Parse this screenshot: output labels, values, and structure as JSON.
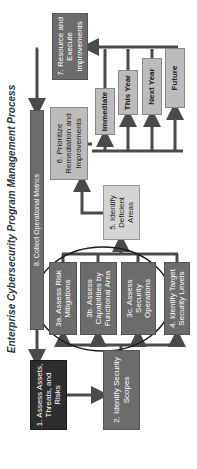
{
  "title": "Enterprise Cybersecurity Program Management Process",
  "steps": {
    "s1": "1. Assess Assets, Threats, and Risks",
    "s2": "2. Identify Security Scopes",
    "s3a": "3a. Assess Risk Mitigations",
    "s3b": "3b. Assess Capabilities by Functional Area",
    "s3c": "3c. Assess Security Operations",
    "s4": "4. Identify Target Security Levels",
    "s5": "5. Identify Deficient Areas",
    "s6": "6. Prioritize Remediation and Improvements",
    "s7": "7. Resource and Execute Improvements",
    "s8": "8. Collect Operational Metrics"
  },
  "priorities": [
    "Immediate",
    "This Year",
    "Next Year",
    "Future"
  ],
  "colors": {
    "dark": "#2e2e2e",
    "mid": "#6c6c6c",
    "light": "#bcbcbc",
    "arrow": "#4a4a4a"
  },
  "orientation": "rotated 90 degrees counter-clockwise"
}
